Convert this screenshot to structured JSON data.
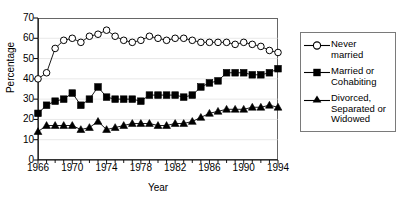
{
  "chart_data": {
    "type": "line",
    "title": "",
    "xlabel": "Year",
    "ylabel": "Percentage",
    "xlim": [
      1966,
      1994
    ],
    "ylim": [
      0,
      70
    ],
    "ytick_step": 10,
    "yticks": [
      0,
      10,
      20,
      30,
      40,
      50,
      60,
      70
    ],
    "xticks_labeled": [
      1966,
      1970,
      1974,
      1978,
      1982,
      1986,
      1990,
      1994
    ],
    "x_minor_tick_step": 1,
    "grid": "horizontal",
    "legend_position": "right",
    "x": [
      1966,
      1967,
      1968,
      1969,
      1970,
      1971,
      1972,
      1973,
      1974,
      1975,
      1976,
      1977,
      1978,
      1979,
      1980,
      1981,
      1982,
      1983,
      1984,
      1985,
      1986,
      1987,
      1988,
      1989,
      1990,
      1991,
      1992,
      1993,
      1994
    ],
    "series": [
      {
        "name": "Never married",
        "marker": "open-circle",
        "color": "#000000",
        "fill": "#ffffff",
        "values": [
          40,
          43,
          55,
          59,
          60,
          58,
          61,
          62,
          64,
          61,
          59,
          58,
          59,
          61,
          60,
          59,
          60,
          60,
          59,
          58,
          58,
          58,
          58,
          57,
          58,
          57,
          56,
          54,
          53
        ]
      },
      {
        "name": "Married or Cohabiting",
        "marker": "filled-square",
        "color": "#000000",
        "fill": "#000000",
        "values": [
          23,
          27,
          29,
          30,
          33,
          27,
          30,
          36,
          31,
          30,
          30,
          30,
          29,
          32,
          32,
          32,
          32,
          31,
          32,
          36,
          38,
          39,
          43,
          43,
          43,
          42,
          42,
          43,
          45
        ]
      },
      {
        "name": "Divorced, Separated or Widowed",
        "marker": "filled-triangle",
        "color": "#000000",
        "fill": "#000000",
        "values": [
          14,
          17,
          17,
          17,
          17,
          15,
          16,
          19,
          15,
          16,
          17,
          18,
          18,
          18,
          17,
          17,
          18,
          18,
          19,
          21,
          23,
          24,
          25,
          25,
          25,
          26,
          26,
          27,
          26
        ]
      }
    ]
  },
  "axis": {
    "y_title": "Percentage",
    "x_title": "Year"
  },
  "legend": {
    "items": [
      {
        "label_line1": "Never married",
        "label_line2": "",
        "label_line3": "",
        "marker": "open-circle"
      },
      {
        "label_line1": "Married or",
        "label_line2": "Cohabiting",
        "label_line3": "",
        "marker": "filled-square"
      },
      {
        "label_line1": "Divorced,",
        "label_line2": "Separated or",
        "label_line3": "Widowed",
        "marker": "filled-triangle"
      }
    ]
  }
}
